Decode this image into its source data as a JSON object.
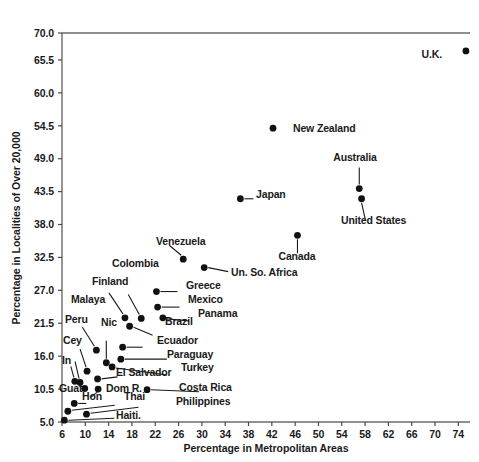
{
  "chart_data": {
    "type": "scatter",
    "title": "",
    "xlabel": "Percentage in Metropolitan Areas",
    "ylabel": "Percentage in Localities of Over 20,000",
    "xlim": [
      6,
      76
    ],
    "ylim": [
      5.0,
      70.0
    ],
    "grid": false,
    "legend": "none",
    "xticks": [
      6,
      10,
      14,
      18,
      22,
      26,
      30,
      34,
      38,
      42,
      46,
      50,
      54,
      58,
      62,
      66,
      70,
      74
    ],
    "yticks": [
      5.0,
      10.5,
      16.0,
      21.5,
      27.0,
      32.5,
      38.0,
      43.5,
      49.0,
      54.5,
      60.0,
      65.5,
      70.0
    ],
    "ytick_labels": [
      "5.0",
      "10.5",
      "16.0",
      "21.5",
      "27.0",
      "32.5",
      "38.0",
      "43.5",
      "49.0",
      "54.5",
      "60.0",
      "65.5",
      "70.0"
    ],
    "xtick_labels": [
      "6",
      "10",
      "14",
      "18",
      "22",
      "26",
      "30",
      "34",
      "38",
      "42",
      "46",
      "50",
      "54",
      "58",
      "62",
      "66",
      "70",
      "74"
    ],
    "points": [
      {
        "label": "U.K.",
        "x": 75.3,
        "y": 67.0,
        "label_side": "left"
      },
      {
        "label": "New Zealand",
        "x": 42.2,
        "y": 54.1,
        "label_side": "right"
      },
      {
        "label": "Australia",
        "x": 57.0,
        "y": 44.0,
        "label_side": "above"
      },
      {
        "label": "United States",
        "x": 57.4,
        "y": 42.3,
        "label_side": "below"
      },
      {
        "label": "Japan",
        "x": 36.6,
        "y": 42.3,
        "label_side": "right"
      },
      {
        "label": "Canada",
        "x": 46.4,
        "y": 36.2,
        "label_side": "below"
      },
      {
        "label": "Venezuela",
        "x": 26.8,
        "y": 32.2,
        "label_side": "above"
      },
      {
        "label": "Un. So. Africa",
        "x": 30.4,
        "y": 30.8,
        "label_side": "right"
      },
      {
        "label": "Greece",
        "x": 22.2,
        "y": 26.8,
        "label_side": "right"
      },
      {
        "label": "Mexico",
        "x": 22.4,
        "y": 24.2,
        "label_side": "right"
      },
      {
        "label": "Panama",
        "x": 23.3,
        "y": 22.4,
        "label_side": "right"
      },
      {
        "label": "Colombia",
        "x": 19.6,
        "y": 22.3,
        "label_side": "above"
      },
      {
        "label": "Finland",
        "x": 16.8,
        "y": 22.4,
        "label_side": "above"
      },
      {
        "label": "Brazil",
        "x": 17.6,
        "y": 21.0,
        "label_side": "right"
      },
      {
        "label": "Malaya",
        "x": 11.9,
        "y": 17.0,
        "label_side": "above"
      },
      {
        "label": "Ecuador",
        "x": 16.4,
        "y": 17.5,
        "label_side": "right"
      },
      {
        "label": "Paraguay",
        "x": 16.1,
        "y": 15.5,
        "label_side": "right"
      },
      {
        "label": "Nic",
        "x": 13.6,
        "y": 14.9,
        "label_side": "above"
      },
      {
        "label": "Turkey",
        "x": 14.6,
        "y": 14.2,
        "label_side": "right"
      },
      {
        "label": "Peru",
        "x": 10.3,
        "y": 13.5,
        "label_side": "above"
      },
      {
        "label": "El Salvador",
        "x": 12.1,
        "y": 12.2,
        "label_side": "right"
      },
      {
        "label": "Cey",
        "x": 9.1,
        "y": 11.6,
        "label_side": "above"
      },
      {
        "label": "In",
        "x": 8.2,
        "y": 11.8,
        "label_side": "above"
      },
      {
        "label": "Dom R.",
        "x": 12.2,
        "y": 10.5,
        "label_side": "right"
      },
      {
        "label": "Costa Rica",
        "x": 20.6,
        "y": 10.4,
        "label_side": "right"
      },
      {
        "label": "Guat",
        "x": 9.9,
        "y": 10.6,
        "label_side": "below"
      },
      {
        "label": "Hon",
        "x": 8.1,
        "y": 8.1,
        "label_side": "right"
      },
      {
        "label": "Thai",
        "x": 7.0,
        "y": 6.8,
        "label_side": "right"
      },
      {
        "label": "Philippines",
        "x": 10.2,
        "y": 6.3,
        "label_side": "right"
      },
      {
        "label": "Haiti.",
        "x": 6.4,
        "y": 5.3,
        "label_side": "right"
      }
    ]
  },
  "axes": {
    "x_title": "Percentage in Metropolitan Areas",
    "y_title": "Percentage in Localities of Over 20,000"
  },
  "colors": {
    "background": "#ffffff",
    "dot": "#111111",
    "axis": "#6b6b6b",
    "text": "#1a1a1a"
  }
}
